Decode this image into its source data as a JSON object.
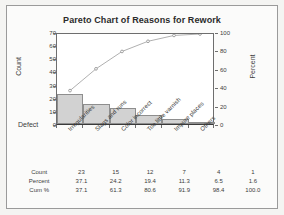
{
  "chart_data": {
    "type": "bar",
    "title": "Pareto Chart of Reasons for Rework",
    "xlabel": "Defect",
    "ylabel": "Count",
    "ylabel_right": "Percent",
    "categories": [
      "Irregularities",
      "Slags and runs",
      "Color incorrect",
      "Too little varnish",
      "Impure places",
      "Others"
    ],
    "values": [
      23,
      15,
      12,
      7,
      4,
      1
    ],
    "percent": [
      37.1,
      24.2,
      19.4,
      11.3,
      6.5,
      1.6
    ],
    "cumulative_percent": [
      37.1,
      61.3,
      80.6,
      91.9,
      98.4,
      100.0
    ],
    "ylim": [
      0,
      70
    ],
    "yticks": [
      0,
      10,
      20,
      30,
      40,
      50,
      60,
      70
    ],
    "ylim_right": [
      0,
      100
    ],
    "yticks_right": [
      0,
      20,
      40,
      60,
      80,
      100
    ],
    "grid": false,
    "legend": "none",
    "series": [
      {
        "name": "Count",
        "type": "bar",
        "values": [
          23,
          15,
          12,
          7,
          4,
          1
        ]
      },
      {
        "name": "Cum %",
        "type": "line",
        "values": [
          37.1,
          61.3,
          80.6,
          91.9,
          98.4,
          100.0
        ]
      }
    ],
    "colors": {
      "bar_fill": "#d2d2d2",
      "bar_edge": "#8e8e8e",
      "line": "#9a9a9a",
      "marker": "#8c8c8c",
      "axis": "#6e6e6e",
      "text": "#3c3c3c",
      "background": "#ffffff",
      "frame_background": "#fbfbfa"
    }
  },
  "table": {
    "rows": [
      {
        "label": "Count",
        "cells": [
          "23",
          "15",
          "12",
          "7",
          "4",
          "1"
        ]
      },
      {
        "label": "Percent",
        "cells": [
          "37.1",
          "24.2",
          "19.4",
          "11.3",
          "6.5",
          "1.6"
        ]
      },
      {
        "label": "Cum %",
        "cells": [
          "37.1",
          "61.3",
          "80.6",
          "91.9",
          "98.4",
          "100.0"
        ]
      }
    ]
  }
}
